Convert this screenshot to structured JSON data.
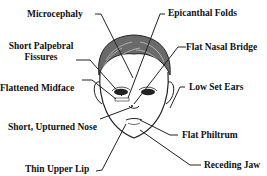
{
  "diagram": {
    "type": "annotated-illustration",
    "colors": {
      "line": "#222222",
      "hair": "#555555",
      "background": "#ffffff"
    },
    "labels": {
      "microcephaly": "Microcephaly",
      "short_palpebral_1": "Short Palpebral",
      "short_palpebral_2": "Fissures",
      "flattened_midface": "Flattened Midface",
      "short_upturned_nose": "Short, Upturned Nose",
      "thin_upper_lip": "Thin Upper Lip",
      "epicanthal_folds": "Epicanthal Folds",
      "flat_nasal_bridge": "Flat Nasal Bridge",
      "low_set_ears": "Low Set Ears",
      "flat_philtrum": "Flat Philtrum",
      "receding_jaw": "Receding Jaw"
    }
  }
}
